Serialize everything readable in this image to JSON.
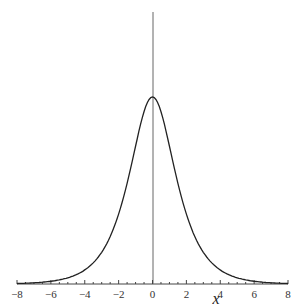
{
  "chart_data": {
    "type": "line",
    "title": "",
    "xlabel": "x",
    "ylabel": "",
    "xlim": [
      -8,
      8
    ],
    "ylim": [
      0,
      1
    ],
    "grid": false,
    "x_ticks": [
      "−8",
      "−6",
      "−4",
      "−2",
      "0",
      "2",
      "4",
      "6",
      "8"
    ],
    "series": [
      {
        "name": "f(x)",
        "x": [
          -8,
          -7,
          -6,
          -5,
          -4,
          -3.5,
          -3,
          -2.5,
          -2,
          -1.5,
          -1,
          -0.5,
          0,
          0.5,
          1,
          1.5,
          2,
          2.5,
          3,
          3.5,
          4,
          5,
          6,
          7,
          8
        ],
        "values": [
          0.002,
          0.005,
          0.012,
          0.028,
          0.066,
          0.102,
          0.155,
          0.234,
          0.35,
          0.51,
          0.72,
          0.92,
          1.0,
          0.92,
          0.72,
          0.51,
          0.35,
          0.234,
          0.155,
          0.102,
          0.066,
          0.028,
          0.012,
          0.005,
          0.002
        ]
      }
    ]
  }
}
